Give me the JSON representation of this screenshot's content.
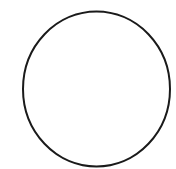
{
  "canvas": {
    "width": 176,
    "height": 169,
    "background": "#ffffff"
  },
  "shapes": [
    {
      "type": "ellipse",
      "name": "circle-outline",
      "cx": 96.5,
      "cy": 89,
      "rx": 73.5,
      "ry": 77.5,
      "stroke": "#1a1a1a",
      "stroke_width": 2,
      "fill": "none"
    }
  ]
}
